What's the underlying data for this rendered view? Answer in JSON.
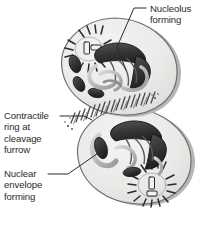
{
  "figure": {
    "name": "telophase-cytokinesis-diagram",
    "background_color": "#ffffff",
    "ink_color": "#2b2b2b",
    "cytoplasm_color": "#e8e8e6",
    "chromatin_color": "#3a3a3a",
    "outline_color": "#6e6e6e",
    "shadow_color": "#b6b6b4"
  },
  "labels": {
    "nucleolus": "Nucleolus\nforming",
    "contractile": "Contractile\nring at\ncleavage\nfurrow",
    "envelope": "Nuclear\nenvelope\nforming"
  },
  "structures": {
    "upper_cell": "daughter-cell-upper",
    "lower_cell": "daughter-cell-lower",
    "upper_centrosome": "centrosome-aster-upper",
    "lower_centrosome": "centrosome-aster-lower",
    "upper_nucleus": "reforming-nucleus-upper",
    "lower_nucleus": "reforming-nucleus-lower",
    "furrow": "cleavage-furrow-contractile-ring"
  }
}
